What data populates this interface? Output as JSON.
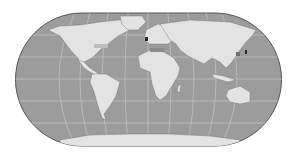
{
  "map": {
    "projection": "Eckert IV style world map",
    "colors": {
      "ocean": "#9c9c9c",
      "land": "#e3e3e3",
      "border": "#5a5a5a",
      "graticule": "#d8d8d8",
      "highlight": "#6e6e6e",
      "dark": "#2a2a2a"
    }
  }
}
